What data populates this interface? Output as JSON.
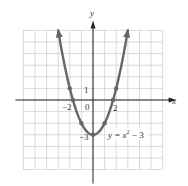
{
  "chart_data": {
    "type": "line",
    "title": "",
    "equation_label": "y = x² − 3",
    "xlabel": "x",
    "ylabel": "y",
    "xlim": [
      -6,
      6
    ],
    "ylim": [
      -6,
      6
    ],
    "grid": true,
    "tick_labels": {
      "x": [
        {
          "value": -2,
          "label": "−2"
        },
        {
          "value": 0,
          "label": "0"
        },
        {
          "value": 2,
          "label": "2"
        }
      ],
      "y": [
        {
          "value": 1,
          "label": "1"
        },
        {
          "value": -3,
          "label": "−3"
        }
      ]
    },
    "series": [
      {
        "name": "y = x^2 - 3",
        "function": "x^2 - 3",
        "x_range": [
          -3,
          3
        ],
        "color": "#666666",
        "arrows_at_ends": true
      }
    ],
    "points": [
      {
        "x": -2,
        "y": 1
      },
      {
        "x": -1.732,
        "y": 0
      },
      {
        "x": -1,
        "y": -2
      },
      {
        "x": 0,
        "y": -3
      },
      {
        "x": 1,
        "y": -2
      },
      {
        "x": 1.732,
        "y": 0
      },
      {
        "x": 2,
        "y": 1
      }
    ]
  },
  "labels": {
    "x_axis": "x",
    "y_axis": "y",
    "tick_neg2": "−2",
    "tick_0": "0",
    "tick_2": "2",
    "tick_1": "1",
    "tick_neg3": "−3",
    "equation_main": "y = x",
    "equation_exp": "2",
    "equation_tail": " − 3"
  },
  "colors": {
    "grid": "#cfcfcf",
    "axis": "#222222",
    "curve": "#6b6b6b",
    "text": "#333333"
  }
}
